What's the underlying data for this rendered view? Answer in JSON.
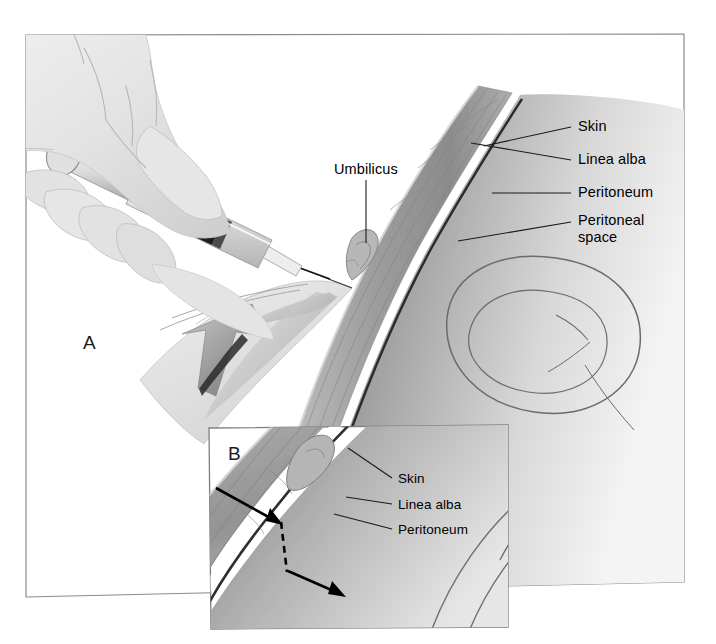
{
  "figure": {
    "type": "medical-illustration",
    "panels": [
      {
        "id": "A",
        "letter": "A",
        "description": "Gloved hand holding syringe inserting needle through the abdominal wall near the umbilicus; large gray arrow indicates downward skin traction (Z-track)."
      },
      {
        "id": "B",
        "letter": "B",
        "description": "Magnified inset of the abdominal wall layers showing the Z-track needle path: arrow in at the skin, dashed line through the layers, arrow out into the peritoneal space."
      }
    ]
  },
  "panel_a": {
    "letter": "A",
    "labels": [
      {
        "id": "umbilicus",
        "text": "Umbilicus"
      },
      {
        "id": "skin",
        "text": "Skin"
      },
      {
        "id": "linea-alba",
        "text": "Linea alba"
      },
      {
        "id": "peritoneum",
        "text": "Peritoneum"
      },
      {
        "id": "peritoneal-space",
        "text": "Peritoneal",
        "text_line2": "space"
      }
    ]
  },
  "panel_b": {
    "letter": "B",
    "labels": [
      {
        "id": "skin",
        "text": "Skin"
      },
      {
        "id": "linea-alba",
        "text": "Linea alba"
      },
      {
        "id": "peritoneum",
        "text": "Peritoneum"
      }
    ]
  },
  "colors": {
    "background": "#ffffff",
    "frame_line": "#808080",
    "label_text": "#000000",
    "leader_line": "#1a1a1a",
    "tissue_mid": "#9a9a9a",
    "tissue_dark": "#6e6e6e",
    "tissue_light": "#c9c9c9",
    "linea_alba": "#ffffff",
    "peritoneum_line": "#2b2b2b",
    "skin_hand": "#e9e9e9",
    "skin_hand_shade": "#d2d2d2",
    "syringe_body": "#e4e4e4",
    "syringe_plunger": "#1c1c1c",
    "arrow_gray": "#9d9d9d",
    "arrow_black": "#000000",
    "bowel_outline": "#6b6b6b"
  }
}
